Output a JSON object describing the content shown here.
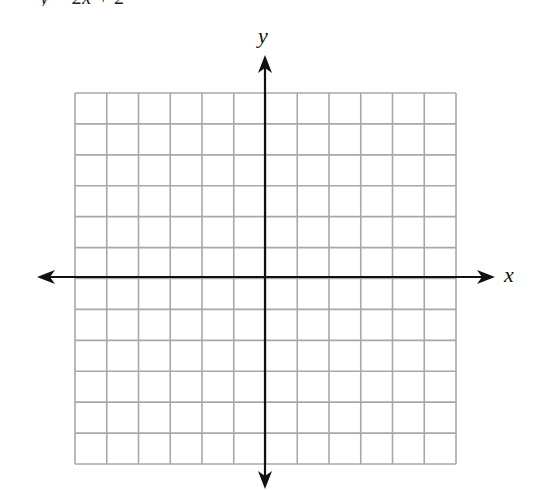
{
  "header": {
    "clipped_text": "y = 2x + 2"
  },
  "axes": {
    "x_label": "x",
    "y_label": "y"
  },
  "chart_data": {
    "type": "blank-coordinate-grid",
    "grid": {
      "columns": 12,
      "rows": 12,
      "x_range": [
        -6,
        6
      ],
      "y_range": [
        -6,
        6
      ],
      "grid_color": "#a8a8a8",
      "axis_color": "#111111"
    },
    "xlabel": "x",
    "ylabel": "y",
    "arrows": [
      "left",
      "right",
      "up",
      "down"
    ]
  }
}
